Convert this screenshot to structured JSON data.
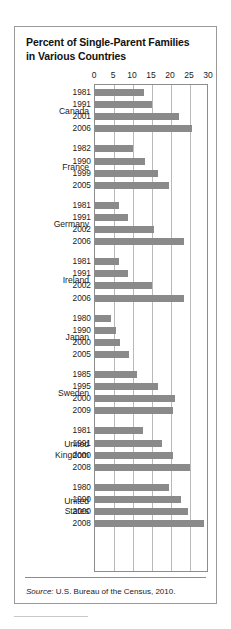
{
  "figure": {
    "title_line1": "Percent of Single-Parent Families",
    "title_line2": "in Various Countries",
    "source_lead": "Source:",
    "source_text": " U.S. Bureau of the Census, 2010."
  },
  "colors": {
    "bar": "#8a8a8a",
    "gridline": "#b9b9b9",
    "frame": "#9a9a9a",
    "plot_border": "#8d8d8d",
    "text": "#1a1a1a",
    "background": "#ffffff"
  },
  "chart_data": {
    "type": "bar",
    "orientation": "horizontal",
    "title": "Percent of Single-Parent Families in Various Countries",
    "xlabel": "",
    "ylabel": "",
    "xlim": [
      0,
      30
    ],
    "xticks": [
      0,
      5,
      10,
      15,
      20,
      25,
      30
    ],
    "xtick_labels": [
      "0",
      "5",
      "10",
      "15",
      "20",
      "25",
      "30"
    ],
    "grid": true,
    "legend": "none",
    "source": "Source: U.S. Bureau of the Census, 2010.",
    "groups": [
      {
        "country": "Canada",
        "country_lines": [
          "Canada"
        ],
        "points": [
          {
            "year": "1981",
            "value": 12.8
          },
          {
            "year": "1991",
            "value": 15.0
          },
          {
            "year": "2001",
            "value": 22.0
          },
          {
            "year": "2006",
            "value": 25.5
          }
        ]
      },
      {
        "country": "France",
        "country_lines": [
          "France"
        ],
        "points": [
          {
            "year": "1982",
            "value": 10.1
          },
          {
            "year": "1990",
            "value": 13.1
          },
          {
            "year": "1999",
            "value": 16.5
          },
          {
            "year": "2005",
            "value": 19.5
          }
        ]
      },
      {
        "country": "Germany",
        "country_lines": [
          "Germany"
        ],
        "points": [
          {
            "year": "1981",
            "value": 6.2
          },
          {
            "year": "1991",
            "value": 8.6
          },
          {
            "year": "2002",
            "value": 15.5
          },
          {
            "year": "2006",
            "value": 23.5
          }
        ]
      },
      {
        "country": "Ireland",
        "country_lines": [
          "Ireland"
        ],
        "points": [
          {
            "year": "1981",
            "value": 6.2
          },
          {
            "year": "1991",
            "value": 8.7
          },
          {
            "year": "2002",
            "value": 15.0
          },
          {
            "year": "2006",
            "value": 23.5
          }
        ]
      },
      {
        "country": "Japan",
        "country_lines": [
          "Japan"
        ],
        "points": [
          {
            "year": "1980",
            "value": 4.2
          },
          {
            "year": "1990",
            "value": 5.5
          },
          {
            "year": "2000",
            "value": 6.6
          },
          {
            "year": "2005",
            "value": 9.0
          }
        ]
      },
      {
        "country": "Sweden",
        "country_lines": [
          "Sweden"
        ],
        "points": [
          {
            "year": "1985",
            "value": 11.0
          },
          {
            "year": "1995",
            "value": 16.6
          },
          {
            "year": "2000",
            "value": 21.0
          },
          {
            "year": "2009",
            "value": 20.4
          }
        ]
      },
      {
        "country": "United Kingdom",
        "country_lines": [
          "United",
          "Kingdom"
        ],
        "points": [
          {
            "year": "1981",
            "value": 12.5
          },
          {
            "year": "1991",
            "value": 17.5
          },
          {
            "year": "2000",
            "value": 20.5
          },
          {
            "year": "2008",
            "value": 25.0
          }
        ]
      },
      {
        "country": "United States",
        "country_lines": [
          "United",
          "States"
        ],
        "points": [
          {
            "year": "1980",
            "value": 19.5
          },
          {
            "year": "1990",
            "value": 22.5
          },
          {
            "year": "2000",
            "value": 24.5
          },
          {
            "year": "2008",
            "value": 28.6
          }
        ]
      }
    ]
  }
}
